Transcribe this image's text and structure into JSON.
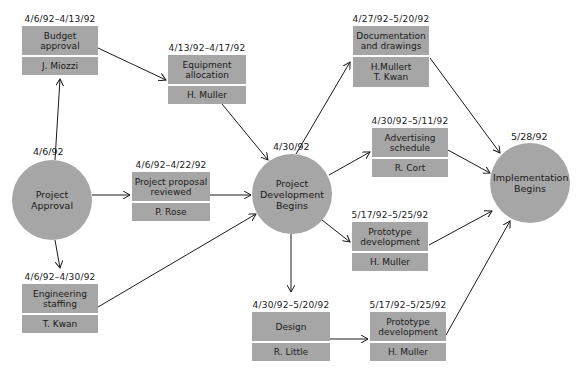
{
  "diagram": {
    "type": "PERT chart",
    "colors": {
      "node_fill": "#a6a6a6",
      "line": "#1a1a1a",
      "background": "#ffffff"
    },
    "milestones": [
      {
        "id": "project_approval",
        "label": "Project Approval",
        "date": "4/6/92"
      },
      {
        "id": "project_dev",
        "label": "Project Development Begins",
        "date": "4/30/92"
      },
      {
        "id": "implementation",
        "label": "Implementation Begins",
        "date": "5/28/92"
      }
    ],
    "tasks": [
      {
        "id": "budget",
        "title": "Budget approval",
        "owner": "J. Miozzi",
        "dates": "4/6/92–4/13/92"
      },
      {
        "id": "equipment",
        "title": "Equipment allocation",
        "owner": "H. Muller",
        "dates": "4/13/92–4/17/92"
      },
      {
        "id": "proposal",
        "title": "Project proposal reviewed",
        "owner": "P. Rose",
        "dates": "4/6/92–4/22/92"
      },
      {
        "id": "engineering",
        "title": "Engineering staffing",
        "owner": "T. Kwan",
        "dates": "4/6/92–4/30/92"
      },
      {
        "id": "documentation",
        "title": "Documentation and drawings",
        "owner": "H.Mullert T. Kwan",
        "dates": "4/27/92–5/20/92"
      },
      {
        "id": "advertising",
        "title": "Advertising schedule",
        "owner": "R. Cort",
        "dates": "4/30/92–5/11/92"
      },
      {
        "id": "prototype1",
        "title": "Prototype development",
        "owner": "H. Muller",
        "dates": "5/17/92–5/25/92"
      },
      {
        "id": "design",
        "title": "Design",
        "owner": "R. Little",
        "dates": "4/30/92–5/20/92"
      },
      {
        "id": "prototype2",
        "title": "Prototype development",
        "owner": "H. Muller",
        "dates": "5/17/92–5/25/92"
      }
    ],
    "edges": [
      [
        "project_approval",
        "budget"
      ],
      [
        "project_approval",
        "proposal"
      ],
      [
        "project_approval",
        "engineering"
      ],
      [
        "budget",
        "equipment"
      ],
      [
        "equipment",
        "project_dev"
      ],
      [
        "proposal",
        "project_dev"
      ],
      [
        "engineering",
        "project_dev"
      ],
      [
        "project_dev",
        "documentation"
      ],
      [
        "project_dev",
        "advertising"
      ],
      [
        "project_dev",
        "prototype1"
      ],
      [
        "project_dev",
        "design"
      ],
      [
        "design",
        "prototype2"
      ],
      [
        "documentation",
        "implementation"
      ],
      [
        "advertising",
        "implementation"
      ],
      [
        "prototype1",
        "implementation"
      ],
      [
        "prototype2",
        "implementation"
      ]
    ]
  }
}
